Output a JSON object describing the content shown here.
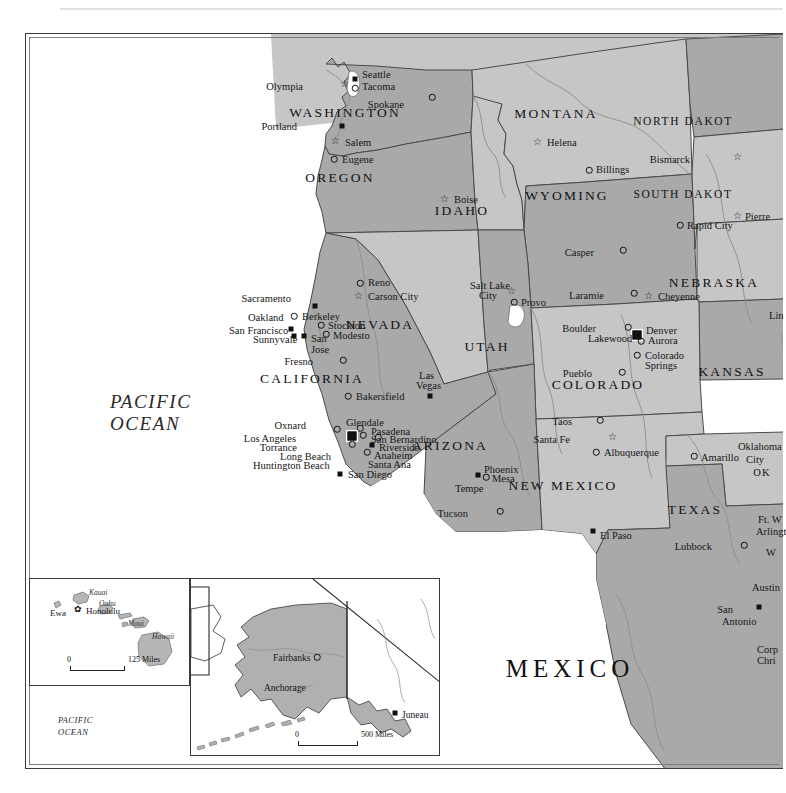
{
  "map": {
    "title": "Western United States reference map",
    "projection_note": "Conic, states shaded alternating grays"
  },
  "oceans": [
    {
      "name": "pacific-ocean-main",
      "line1": "PACIFIC",
      "line2": "OCEAN",
      "x": 110,
      "y": 392
    },
    {
      "name": "pacific-ocean-hawaii",
      "line1": "PACIFIC OCEAN",
      "x": 42,
      "y": 645
    },
    {
      "name": "pacific-ocean-alaska",
      "line1": "PACIFIC",
      "line2": "OCEAN",
      "x": 58,
      "y": 716
    }
  ],
  "countries": [
    {
      "label": "MEXICO",
      "x": 570,
      "y": 668,
      "size": "mex"
    },
    {
      "label": "RUSSIA",
      "x": 199,
      "y": 592,
      "size": "sm"
    },
    {
      "label": "CANADA",
      "x": 352,
      "y": 677,
      "size": "sm"
    },
    {
      "label": "ALASKA",
      "x": 282,
      "y": 613,
      "size": "sm"
    },
    {
      "label": "HAWAII",
      "x": 68,
      "y": 624,
      "size": "sm"
    }
  ],
  "states": [
    {
      "label": "WASHINGTON",
      "x": 345,
      "y": 113,
      "fill": "#a9a9a9"
    },
    {
      "label": "OREGON",
      "x": 340,
      "y": 178,
      "fill": "#a9a9a9"
    },
    {
      "label": "IDAHO",
      "x": 462,
      "y": 211,
      "fill": "#c6c6c6"
    },
    {
      "label": "MONTANA",
      "x": 556,
      "y": 114,
      "fill": "#c6c6c6"
    },
    {
      "label": "WYOMING",
      "x": 567,
      "y": 196,
      "fill": "#a9a9a9"
    },
    {
      "label": "NEVADA",
      "x": 380,
      "y": 325,
      "fill": "#c6c6c6"
    },
    {
      "label": "UTAH",
      "x": 487,
      "y": 347,
      "fill": "#a9a9a9"
    },
    {
      "label": "COLORADO",
      "x": 598,
      "y": 385,
      "fill": "#c6c6c6"
    },
    {
      "label": "CALIFORNIA",
      "x": 312,
      "y": 379,
      "fill": "#a9a9a9"
    },
    {
      "label": "ARIZONA",
      "x": 450,
      "y": 446,
      "fill": "#a9a9a9"
    },
    {
      "label": "NEW MEXICO",
      "x": 563,
      "y": 486,
      "fill": "#c6c6c6"
    },
    {
      "label": "TEXAS",
      "x": 695,
      "y": 510,
      "fill": "#a9a9a9"
    },
    {
      "label": "KANSAS",
      "x": 732,
      "y": 372,
      "fill": "#a9a9a9"
    },
    {
      "label": "NEBRASKA",
      "x": 714,
      "y": 283,
      "fill": "#c6c6c6"
    },
    {
      "label": "NORTH DAKOT",
      "x": 683,
      "y": 122,
      "fill": "#a9a9a9"
    },
    {
      "label": "SOUTH DAKOT",
      "x": 683,
      "y": 195,
      "fill": "#c6c6c6"
    },
    {
      "label": "OK",
      "x": 762,
      "y": 473,
      "fill": "#c6c6c6"
    }
  ],
  "cities": [
    {
      "name": "Seattle",
      "marker": "sq",
      "mx": 355,
      "my": 79,
      "tx": 362,
      "ty": 70,
      "align": "left"
    },
    {
      "name": "Olympia",
      "marker": "star",
      "mx": 344,
      "my": 84,
      "tx": 303,
      "ty": 82,
      "align": "right"
    },
    {
      "name": "Tacoma",
      "marker": "circ",
      "mx": 355,
      "my": 88,
      "tx": 362,
      "ty": 82,
      "align": "left"
    },
    {
      "name": "Spokane",
      "marker": "circ",
      "mx": 432,
      "my": 97,
      "tx": 404,
      "ty": 100,
      "align": "right"
    },
    {
      "name": "Portland",
      "marker": "sq",
      "mx": 342,
      "my": 126,
      "tx": 297,
      "ty": 122,
      "align": "right"
    },
    {
      "name": "Salem",
      "marker": "star",
      "mx": 335,
      "my": 141,
      "tx": 345,
      "ty": 138,
      "align": "left"
    },
    {
      "name": "Eugene",
      "marker": "circ",
      "mx": 334,
      "my": 159,
      "tx": 342,
      "ty": 155,
      "align": "left"
    },
    {
      "name": "Boise",
      "marker": "star",
      "mx": 444,
      "my": 199,
      "tx": 454,
      "ty": 195,
      "align": "left"
    },
    {
      "name": "Helena",
      "marker": "star",
      "mx": 537,
      "my": 142,
      "tx": 547,
      "ty": 138,
      "align": "left"
    },
    {
      "name": "Billings",
      "marker": "circ",
      "mx": 589,
      "my": 170,
      "tx": 596,
      "ty": 165,
      "align": "left"
    },
    {
      "name": "Casper",
      "marker": "circ",
      "mx": 623,
      "my": 250,
      "tx": 594,
      "ty": 248,
      "align": "right"
    },
    {
      "name": "Laramie",
      "marker": "circ",
      "mx": 634,
      "my": 293,
      "tx": 604,
      "ty": 291,
      "align": "right"
    },
    {
      "name": "Cheyenne",
      "marker": "star",
      "mx": 648,
      "my": 296,
      "tx": 658,
      "ty": 292,
      "align": "left"
    },
    {
      "name": "Bismarck",
      "marker": "star",
      "mx": 737,
      "my": 157,
      "tx": 690,
      "ty": 155,
      "align": "right"
    },
    {
      "name": "Pierre",
      "marker": "star",
      "mx": 737,
      "my": 216,
      "tx": 745,
      "ty": 212,
      "align": "left"
    },
    {
      "name": "Rapid City",
      "marker": "circ",
      "mx": 680,
      "my": 225,
      "tx": 687,
      "ty": 221,
      "align": "left"
    },
    {
      "name": "Lin",
      "marker": "none",
      "mx": 0,
      "my": 0,
      "tx": 769,
      "ty": 311,
      "align": "left"
    },
    {
      "name": "Reno",
      "marker": "circ",
      "mx": 360,
      "my": 283,
      "tx": 368,
      "ty": 278,
      "align": "left"
    },
    {
      "name": "Carson City",
      "marker": "star",
      "mx": 358,
      "my": 296,
      "tx": 368,
      "ty": 292,
      "align": "left"
    },
    {
      "name": "Sacramento",
      "marker": "sq",
      "mx": 315,
      "my": 306,
      "tx": 291,
      "ty": 294,
      "align": "right"
    },
    {
      "name": "Berkeley",
      "marker": "circ",
      "mx": 294,
      "my": 316,
      "tx": 302,
      "ty": 312,
      "align": "left"
    },
    {
      "name": "Oakland",
      "marker": "none",
      "mx": 0,
      "my": 0,
      "tx": 248,
      "ty": 313,
      "align": "left"
    },
    {
      "name": "San Francisco",
      "marker": "sq",
      "mx": 291,
      "my": 329,
      "tx": 229,
      "ty": 326,
      "align": "left"
    },
    {
      "name": "Sunnyvale",
      "marker": "sq",
      "mx": 294,
      "my": 336,
      "tx": 253,
      "ty": 335,
      "align": "left"
    },
    {
      "name": "Stockton",
      "marker": "circ",
      "mx": 321,
      "my": 325,
      "tx": 328,
      "ty": 321,
      "align": "left"
    },
    {
      "name": "Modesto",
      "marker": "circ",
      "mx": 326,
      "my": 334,
      "tx": 333,
      "ty": 331,
      "align": "left"
    },
    {
      "name": "San",
      "marker": "sq",
      "mx": 304,
      "my": 336,
      "tx": 311,
      "ty": 334,
      "align": "left"
    },
    {
      "name": "Jose",
      "marker": "none",
      "mx": 0,
      "my": 0,
      "tx": 311,
      "ty": 345,
      "align": "left"
    },
    {
      "name": "Fresno",
      "marker": "circ",
      "mx": 343,
      "my": 360,
      "tx": 313,
      "ty": 357,
      "align": "right"
    },
    {
      "name": "Bakersfield",
      "marker": "circ",
      "mx": 348,
      "my": 396,
      "tx": 356,
      "ty": 392,
      "align": "left"
    },
    {
      "name": "Las",
      "marker": "none",
      "mx": 0,
      "my": 0,
      "tx": 419,
      "ty": 371,
      "align": "left"
    },
    {
      "name": "Vegas",
      "marker": "sq",
      "mx": 430,
      "my": 396,
      "tx": 416,
      "ty": 381,
      "align": "left"
    },
    {
      "name": "Oxnard",
      "marker": "circ",
      "mx": 337,
      "my": 429,
      "tx": 306,
      "ty": 421,
      "align": "right"
    },
    {
      "name": "Glendale",
      "marker": "circ",
      "mx": 360,
      "my": 428,
      "tx": 346,
      "ty": 418,
      "align": "left"
    },
    {
      "name": "Pasadena",
      "marker": "circ",
      "mx": 363,
      "my": 435,
      "tx": 371,
      "ty": 427,
      "align": "left"
    },
    {
      "name": "Los Angeles",
      "marker": "cap",
      "mx": 352,
      "my": 436,
      "tx": 296,
      "ty": 434,
      "align": "right"
    },
    {
      "name": "San Bernardino",
      "marker": "circ",
      "mx": 378,
      "my": 437,
      "tx": 371,
      "ty": 435,
      "align": "left"
    },
    {
      "name": "Torrance",
      "marker": "circ",
      "mx": 352,
      "my": 444,
      "tx": 297,
      "ty": 443,
      "align": "right"
    },
    {
      "name": "Riverside",
      "marker": "sq",
      "mx": 372,
      "my": 445,
      "tx": 379,
      "ty": 443,
      "align": "left"
    },
    {
      "name": "Anaheim",
      "marker": "circ",
      "mx": 367,
      "my": 452,
      "tx": 374,
      "ty": 451,
      "align": "left"
    },
    {
      "name": "Long Beach",
      "marker": "none",
      "mx": 0,
      "my": 0,
      "tx": 280,
      "ty": 452,
      "align": "left"
    },
    {
      "name": "Santa Ana",
      "marker": "none",
      "mx": 0,
      "my": 0,
      "tx": 368,
      "ty": 460,
      "align": "left"
    },
    {
      "name": "Huntington Beach",
      "marker": "none",
      "mx": 0,
      "my": 0,
      "tx": 253,
      "ty": 461,
      "align": "left"
    },
    {
      "name": "San Diego",
      "marker": "sq",
      "mx": 340,
      "my": 474,
      "tx": 348,
      "ty": 470,
      "align": "left"
    },
    {
      "name": "Salt Lake",
      "marker": "none",
      "mx": 0,
      "my": 0,
      "tx": 470,
      "ty": 281,
      "align": "left"
    },
    {
      "name": "City",
      "marker": "star",
      "mx": 511,
      "my": 291,
      "tx": 479,
      "ty": 291,
      "align": "left"
    },
    {
      "name": "Provo",
      "marker": "circ",
      "mx": 514,
      "my": 302,
      "tx": 521,
      "ty": 298,
      "align": "left"
    },
    {
      "name": "Boulder",
      "marker": "circ",
      "mx": 628,
      "my": 327,
      "tx": 596,
      "ty": 324,
      "align": "right"
    },
    {
      "name": "Denver",
      "marker": "cap",
      "mx": 637,
      "my": 335,
      "tx": 646,
      "ty": 326,
      "align": "left"
    },
    {
      "name": "Lakewood",
      "marker": "none",
      "mx": 0,
      "my": 0,
      "tx": 588,
      "ty": 334,
      "align": "left"
    },
    {
      "name": "Aurora",
      "marker": "circ",
      "mx": 641,
      "my": 341,
      "tx": 648,
      "ty": 336,
      "align": "left"
    },
    {
      "name": "Colorado",
      "marker": "circ",
      "mx": 637,
      "my": 355,
      "tx": 645,
      "ty": 351,
      "align": "left"
    },
    {
      "name": "Springs",
      "marker": "none",
      "mx": 0,
      "my": 0,
      "tx": 645,
      "ty": 361,
      "align": "left"
    },
    {
      "name": "Pueblo",
      "marker": "circ",
      "mx": 622,
      "my": 372,
      "tx": 592,
      "ty": 369,
      "align": "right"
    },
    {
      "name": "Taos",
      "marker": "circ",
      "mx": 600,
      "my": 420,
      "tx": 572,
      "ty": 417,
      "align": "right"
    },
    {
      "name": "Santa Fe",
      "marker": "star",
      "mx": 612,
      "my": 437,
      "tx": 570,
      "ty": 435,
      "align": "right"
    },
    {
      "name": "Albuquerque",
      "marker": "circ",
      "mx": 596,
      "my": 452,
      "tx": 604,
      "ty": 448,
      "align": "left"
    },
    {
      "name": "Phoenix",
      "marker": "sq",
      "mx": 478,
      "my": 475,
      "tx": 484,
      "ty": 465,
      "align": "left"
    },
    {
      "name": "Mesa",
      "marker": "circ",
      "mx": 486,
      "my": 477,
      "tx": 492,
      "ty": 474,
      "align": "left"
    },
    {
      "name": "Tempe",
      "marker": "none",
      "mx": 0,
      "my": 0,
      "tx": 455,
      "ty": 484,
      "align": "left"
    },
    {
      "name": "Tucson",
      "marker": "circ",
      "mx": 500,
      "my": 511,
      "tx": 468,
      "ty": 509,
      "align": "right"
    },
    {
      "name": "El Paso",
      "marker": "sq",
      "mx": 593,
      "my": 531,
      "tx": 600,
      "ty": 531,
      "align": "left"
    },
    {
      "name": "Amarillo",
      "marker": "circ",
      "mx": 694,
      "my": 456,
      "tx": 701,
      "ty": 453,
      "align": "left"
    },
    {
      "name": "Oklahoma",
      "marker": "none",
      "mx": 0,
      "my": 0,
      "tx": 738,
      "ty": 442,
      "align": "left"
    },
    {
      "name": "City",
      "marker": "none",
      "mx": 0,
      "my": 0,
      "tx": 746,
      "ty": 455,
      "align": "left"
    },
    {
      "name": "Ft. W",
      "marker": "none",
      "mx": 0,
      "my": 0,
      "tx": 758,
      "ty": 515,
      "align": "left"
    },
    {
      "name": "Arlingt",
      "marker": "none",
      "mx": 0,
      "my": 0,
      "tx": 756,
      "ty": 527,
      "align": "left"
    },
    {
      "name": "Lubbock",
      "marker": "circ",
      "mx": 744,
      "my": 545,
      "tx": 712,
      "ty": 542,
      "align": "right"
    },
    {
      "name": "W",
      "marker": "none",
      "mx": 0,
      "my": 0,
      "tx": 766,
      "ty": 548,
      "align": "left"
    },
    {
      "name": "Austin",
      "marker": "none",
      "mx": 0,
      "my": 0,
      "tx": 752,
      "ty": 583,
      "align": "left"
    },
    {
      "name": "San",
      "marker": "sq",
      "mx": 759,
      "my": 607,
      "tx": 733,
      "ty": 605,
      "align": "right"
    },
    {
      "name": "Antonio",
      "marker": "none",
      "mx": 0,
      "my": 0,
      "tx": 722,
      "ty": 617,
      "align": "left"
    },
    {
      "name": "Corp",
      "marker": "none",
      "mx": 0,
      "my": 0,
      "tx": 757,
      "ty": 645,
      "align": "left"
    },
    {
      "name": "Chri",
      "marker": "none",
      "mx": 0,
      "my": 0,
      "tx": 757,
      "ty": 656,
      "align": "left"
    }
  ],
  "hawaii_inset": {
    "islands": [
      "Kauai",
      "Oahu",
      "Maui",
      "Hawaii"
    ],
    "cities": [
      {
        "name": "Ewa",
        "marker": "none",
        "tx": 50,
        "ty": 609
      },
      {
        "name": "Honolulu",
        "marker": "flower",
        "mx": 78,
        "my": 609,
        "tx": 86,
        "ty": 607
      }
    ],
    "island_labels": [
      {
        "label": "Kauai",
        "x": 89,
        "y": 589
      },
      {
        "label": "Oahu",
        "x": 99,
        "y": 600
      },
      {
        "label": "Maui",
        "x": 128,
        "y": 620
      },
      {
        "label": "Hawaii",
        "x": 152,
        "y": 633
      }
    ],
    "scale": {
      "zero": "0",
      "value": "125 Miles",
      "x": 70,
      "y": 666,
      "width": 55
    }
  },
  "alaska_inset": {
    "cities": [
      {
        "name": "Fairbanks",
        "marker": "circ",
        "mx": 317,
        "my": 657,
        "tx": 273,
        "ty": 654
      },
      {
        "name": "Anchorage",
        "marker": "none",
        "tx": 264,
        "ty": 684
      },
      {
        "name": "Juneau",
        "marker": "sq",
        "mx": 395,
        "my": 713,
        "tx": 402,
        "ty": 711
      }
    ],
    "scale": {
      "zero": "0",
      "value": "500 Miles",
      "x": 298,
      "y": 741,
      "width": 60
    }
  },
  "colors": {
    "state_dark": "#a9a9a9",
    "state_light": "#c6c6c6",
    "border": "#3a3a3a",
    "water": "#ffffff",
    "river": "#8d8d8d",
    "text": "#161616"
  }
}
